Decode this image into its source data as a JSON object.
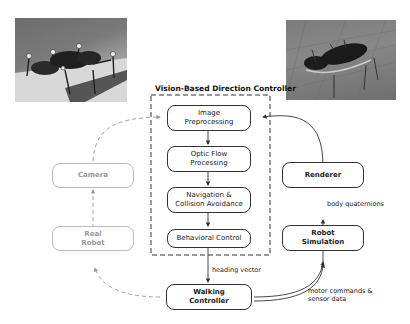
{
  "title": "Vision-Based Direction Controller",
  "images": {
    "real_robot_photo": "real-hexapod-robot-photo",
    "simulated_robot_render": "simulated-hexapod-robot-render"
  },
  "pipeline": [
    {
      "id": "image-preprocessing",
      "label": "Image\nPreprocessing"
    },
    {
      "id": "optic-flow-processing",
      "label": "Optic Flow\nProcessing"
    },
    {
      "id": "navigation-collision-avoidance",
      "label": "Navigation &\nCollision Avoidance"
    },
    {
      "id": "behavioral-control",
      "label": "Behavioral Control"
    }
  ],
  "nodes": {
    "walking_controller": "Walking\nController",
    "camera": "Camera",
    "real_robot": "Real\nRobot",
    "renderer": "Renderer",
    "robot_simulation": "Robot\nSimulation"
  },
  "edge_labels": {
    "heading_vector": "heading vector",
    "body_quaternions": "body quaternions",
    "motor_commands": "motor commands &\nsensor data"
  },
  "colors": {
    "active_border": "#333333",
    "faded_border": "#bbbbbb",
    "faded_text": "#999999",
    "dashed_line": "#999999"
  }
}
